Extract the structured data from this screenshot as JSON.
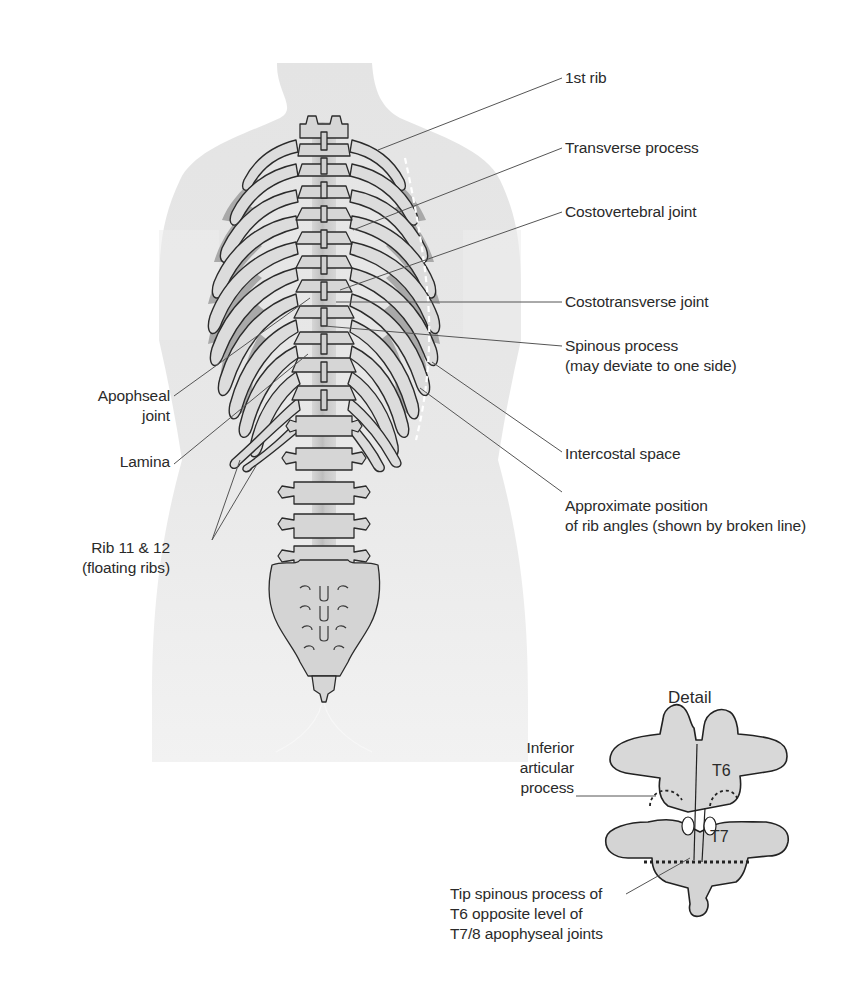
{
  "figure": {
    "type": "anatomical-diagram",
    "colors": {
      "background": "#ffffff",
      "body_silhouette": "#e6e6e6",
      "bone_fill": "#d9d9d9",
      "bone_shadow": "#a9a9a9",
      "intercostal_fill": "#9e9e9e",
      "outline": "#2b2b2b",
      "leader_line": "#555555",
      "rib_angle_line": "#ffffff"
    }
  },
  "labels_right": [
    {
      "id": "first-rib",
      "lines": [
        "1st rib"
      ]
    },
    {
      "id": "transverse-process",
      "lines": [
        "Transverse process"
      ]
    },
    {
      "id": "costovertebral-joint",
      "lines": [
        "Costovertebral joint"
      ]
    },
    {
      "id": "costotransverse-joint",
      "lines": [
        "Costotransverse joint"
      ]
    },
    {
      "id": "spinous-process",
      "lines": [
        "Spinous process",
        "(may deviate to one side)"
      ]
    },
    {
      "id": "intercostal-space",
      "lines": [
        "Intercostal space"
      ]
    },
    {
      "id": "rib-angles",
      "lines": [
        "Approximate position",
        "of rib angles (shown by broken line)"
      ]
    }
  ],
  "labels_left": [
    {
      "id": "apophseal-joint",
      "lines": [
        "Apophseal",
        "joint"
      ]
    },
    {
      "id": "lamina",
      "lines": [
        "Lamina"
      ]
    },
    {
      "id": "floating-ribs",
      "lines": [
        "Rib 11 & 12",
        "(floating ribs)"
      ]
    }
  ],
  "detail": {
    "title": "Detail",
    "vertebra_upper": "T6",
    "vertebra_lower": "T7",
    "labels": [
      {
        "id": "inferior-articular-process",
        "lines": [
          "Inferior",
          "articular",
          "process"
        ]
      },
      {
        "id": "tip-spinous-process",
        "lines": [
          "Tip spinous process of",
          "T6 opposite level of",
          "T7/8 apophyseal joints"
        ]
      }
    ]
  }
}
